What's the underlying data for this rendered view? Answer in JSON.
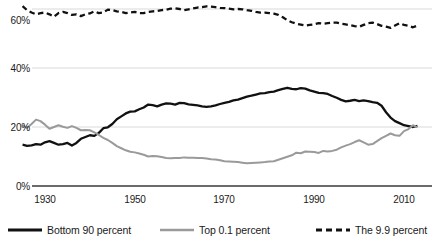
{
  "chart_data": {
    "type": "line",
    "title": "",
    "xlabel": "",
    "ylabel": "",
    "xlim": [
      1925,
      2014
    ],
    "ylim": [
      0,
      65
    ],
    "grid": "horizontal",
    "legend_position": "bottom",
    "y_ticks": [
      "0%",
      "20%",
      "40%",
      "60%"
    ],
    "y_tick_values": [
      0,
      20,
      40,
      60
    ],
    "x_ticks": [
      "1930",
      "1950",
      "1970",
      "1990",
      "2010"
    ],
    "x_tick_values": [
      1930,
      1950,
      1970,
      1990,
      2010
    ],
    "series": [
      {
        "name": "Bottom 90 percent",
        "color": "#111111",
        "style": "solid",
        "width": 2.3,
        "x": [
          1925,
          1926,
          1927,
          1928,
          1929,
          1930,
          1931,
          1932,
          1933,
          1934,
          1935,
          1936,
          1937,
          1938,
          1939,
          1940,
          1941,
          1942,
          1943,
          1944,
          1945,
          1946,
          1947,
          1948,
          1949,
          1950,
          1951,
          1952,
          1953,
          1954,
          1955,
          1956,
          1957,
          1958,
          1959,
          1960,
          1961,
          1962,
          1963,
          1964,
          1965,
          1966,
          1967,
          1968,
          1969,
          1970,
          1971,
          1972,
          1973,
          1974,
          1975,
          1976,
          1977,
          1978,
          1979,
          1980,
          1981,
          1982,
          1983,
          1984,
          1985,
          1986,
          1987,
          1988,
          1989,
          1990,
          1991,
          1992,
          1993,
          1994,
          1995,
          1996,
          1997,
          1998,
          1999,
          2000,
          2001,
          2002,
          2003,
          2004,
          2005,
          2006,
          2007,
          2008,
          2009,
          2010,
          2011,
          2012,
          2013
        ],
        "values": [
          14.0,
          13.6,
          13.8,
          14.2,
          14.0,
          14.8,
          15.2,
          14.6,
          14.0,
          14.2,
          14.6,
          13.7,
          14.6,
          16.0,
          16.6,
          17.2,
          17.0,
          18.0,
          19.6,
          19.9,
          21.0,
          22.6,
          23.6,
          24.6,
          25.2,
          25.3,
          26.0,
          26.6,
          27.6,
          27.4,
          27.0,
          27.6,
          28.0,
          27.9,
          27.6,
          28.2,
          28.1,
          27.7,
          27.5,
          27.3,
          27.0,
          26.8,
          27.0,
          27.3,
          27.8,
          28.2,
          28.5,
          29.0,
          29.3,
          29.8,
          30.3,
          30.6,
          31.0,
          31.4,
          31.5,
          31.8,
          32.0,
          32.5,
          32.9,
          33.3,
          32.9,
          32.8,
          33.2,
          33.0,
          32.4,
          32.0,
          31.6,
          31.5,
          31.2,
          30.5,
          29.9,
          29.2,
          28.7,
          28.9,
          29.2,
          28.8,
          29.0,
          28.8,
          28.4,
          28.2,
          27.2,
          25.0,
          23.2,
          22.0,
          21.3,
          20.6,
          20.3,
          20.0,
          20.4
        ]
      },
      {
        "name": "Top 0.1 percent",
        "color": "#9a9a9a",
        "style": "solid",
        "width": 2.0,
        "x": [
          1925,
          1926,
          1927,
          1928,
          1929,
          1930,
          1931,
          1932,
          1933,
          1934,
          1935,
          1936,
          1937,
          1938,
          1939,
          1940,
          1941,
          1942,
          1943,
          1944,
          1945,
          1946,
          1947,
          1948,
          1949,
          1950,
          1951,
          1952,
          1953,
          1954,
          1955,
          1956,
          1957,
          1958,
          1959,
          1960,
          1961,
          1962,
          1963,
          1964,
          1965,
          1966,
          1967,
          1968,
          1969,
          1970,
          1971,
          1972,
          1973,
          1974,
          1975,
          1976,
          1977,
          1978,
          1979,
          1980,
          1981,
          1982,
          1983,
          1984,
          1985,
          1986,
          1987,
          1988,
          1989,
          1990,
          1991,
          1992,
          1993,
          1994,
          1995,
          1996,
          1997,
          1998,
          1999,
          2000,
          2001,
          2002,
          2003,
          2004,
          2005,
          2006,
          2007,
          2008,
          2009,
          2010,
          2011,
          2012,
          2013
        ],
        "values": [
          20.6,
          19.7,
          21.0,
          22.5,
          22.0,
          20.8,
          19.4,
          20.0,
          20.6,
          20.1,
          19.7,
          20.3,
          19.7,
          18.9,
          19.0,
          18.9,
          18.2,
          17.3,
          16.3,
          15.6,
          14.6,
          13.5,
          12.8,
          12.1,
          11.6,
          11.4,
          11.0,
          10.6,
          10.0,
          10.2,
          10.1,
          9.8,
          9.5,
          9.4,
          9.5,
          9.5,
          9.7,
          9.6,
          9.6,
          9.5,
          9.5,
          9.3,
          9.1,
          9.0,
          8.7,
          8.4,
          8.3,
          8.2,
          8.1,
          7.9,
          7.7,
          7.8,
          7.9,
          8.0,
          8.1,
          8.3,
          8.4,
          8.9,
          9.4,
          9.9,
          10.4,
          11.3,
          11.1,
          11.7,
          11.6,
          11.5,
          11.2,
          11.9,
          11.7,
          11.9,
          12.3,
          13.1,
          13.7,
          14.2,
          14.9,
          15.5,
          14.8,
          14.0,
          14.2,
          15.2,
          16.2,
          17.0,
          17.8,
          17.2,
          17.0,
          18.6,
          19.3,
          20.6,
          19.9
        ]
      },
      {
        "name": "The 9.9 percent",
        "color": "#111111",
        "style": "dashed",
        "width": 2.3,
        "x": [
          1925,
          1926,
          1927,
          1928,
          1929,
          1930,
          1931,
          1932,
          1933,
          1934,
          1935,
          1936,
          1937,
          1938,
          1939,
          1940,
          1941,
          1942,
          1943,
          1944,
          1945,
          1946,
          1947,
          1948,
          1949,
          1950,
          1951,
          1952,
          1953,
          1954,
          1955,
          1956,
          1957,
          1958,
          1959,
          1960,
          1961,
          1962,
          1963,
          1964,
          1965,
          1966,
          1967,
          1968,
          1969,
          1970,
          1971,
          1972,
          1973,
          1974,
          1975,
          1976,
          1977,
          1978,
          1979,
          1980,
          1981,
          1982,
          1983,
          1984,
          1985,
          1986,
          1987,
          1988,
          1989,
          1990,
          1991,
          1992,
          1993,
          1994,
          1995,
          1996,
          1997,
          1998,
          1999,
          2000,
          2001,
          2002,
          2003,
          2004,
          2005,
          2006,
          2007,
          2008,
          2009,
          2010,
          2011,
          2012,
          2013
        ],
        "values": [
          61.0,
          59.6,
          58.8,
          58.2,
          58.6,
          58.8,
          58.2,
          57.4,
          58.6,
          59.0,
          58.6,
          58.0,
          58.2,
          57.6,
          58.2,
          58.5,
          59.2,
          58.6,
          58.8,
          59.8,
          59.6,
          59.2,
          59.0,
          58.6,
          58.8,
          59.0,
          58.6,
          58.6,
          59.0,
          59.2,
          59.3,
          59.6,
          59.8,
          60.1,
          60.2,
          60.0,
          59.6,
          59.9,
          60.2,
          60.5,
          60.6,
          60.9,
          60.8,
          60.6,
          60.4,
          60.3,
          60.1,
          59.9,
          60.0,
          59.9,
          59.6,
          59.4,
          59.0,
          58.8,
          58.8,
          58.6,
          58.4,
          58.0,
          57.2,
          56.2,
          55.5,
          55.0,
          54.7,
          54.4,
          54.6,
          54.8,
          55.2,
          55.0,
          55.2,
          55.4,
          55.4,
          55.0,
          54.8,
          54.5,
          54.2,
          54.0,
          54.6,
          55.2,
          55.4,
          54.9,
          54.3,
          54.0,
          53.6,
          54.4,
          55.2,
          54.6,
          54.3,
          53.8,
          54.4
        ]
      }
    ]
  },
  "axis": {
    "y_labels": [
      "60%",
      "40%",
      "20%",
      "0%"
    ],
    "x_labels": [
      "1930",
      "1950",
      "1970",
      "1990",
      "2010"
    ]
  },
  "legend": {
    "items": [
      {
        "label": "Bottom 90 percent"
      },
      {
        "label": "Top 0.1 percent"
      },
      {
        "label": "The 9.9 percent"
      }
    ]
  },
  "colors": {
    "bottom90": "#111111",
    "top01": "#9a9a9a",
    "nine9": "#111111",
    "grid": "#d9d9d9",
    "axis": "#555555",
    "text": "#1a1a1a"
  }
}
